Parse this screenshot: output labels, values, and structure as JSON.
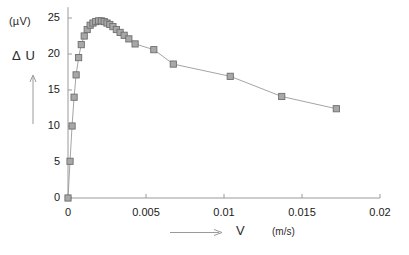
{
  "chart_data": {
    "type": "line",
    "title": "",
    "xlabel": "V",
    "xunit": "(m/s)",
    "ylabel": "Δ U",
    "yunit": "(µV)",
    "xlim": [
      0,
      0.02
    ],
    "ylim": [
      0,
      26.5
    ],
    "xticks": [
      0,
      0.005,
      0.01,
      0.015,
      0.02
    ],
    "xtick_labels": [
      "0",
      "0.005",
      "0.01",
      "0.015",
      "0.02"
    ],
    "yticks": [
      0,
      5,
      10,
      15,
      20,
      25
    ],
    "ytick_labels": [
      "0",
      "5",
      "10",
      "15",
      "20",
      "25"
    ],
    "grid": false,
    "legend": null,
    "marker": "square",
    "marker_fill": "#a8a8a8",
    "marker_edge": "#6e6e6e",
    "line_color": "#9a9a9a",
    "axis_color": "#9a9a9a",
    "series": [
      {
        "name": "ΔU vs V",
        "x": [
          0.0,
          0.00013,
          0.00026,
          0.00039,
          0.00052,
          0.00068,
          0.00085,
          0.00104,
          0.00123,
          0.00142,
          0.0016,
          0.00178,
          0.00196,
          0.00214,
          0.00232,
          0.0025,
          0.00268,
          0.00288,
          0.0031,
          0.00334,
          0.0036,
          0.0039,
          0.0043,
          0.0055,
          0.00675,
          0.0104,
          0.0137,
          0.0172
        ],
        "y": [
          0.0,
          5.1,
          10.0,
          14.0,
          17.1,
          19.5,
          21.3,
          22.5,
          23.4,
          24.0,
          24.3,
          24.5,
          24.6,
          24.6,
          24.5,
          24.3,
          24.1,
          23.8,
          23.4,
          23.0,
          22.6,
          22.1,
          21.4,
          20.6,
          18.6,
          16.9,
          14.1,
          12.4
        ]
      }
    ]
  },
  "axis_geometry": {
    "x0_px": 68,
    "y0_px": 198,
    "x_per_unit_px": 15600,
    "y_per_unit_px": 7.2
  }
}
